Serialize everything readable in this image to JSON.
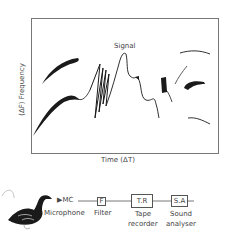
{
  "spectrogram": {
    "signal_label": "Signal",
    "x_axis_label": "Time (ΔT)",
    "y_axis_label": "(ΔF) Frequency"
  },
  "pipeline": {
    "source_icon": "goose-bird-icon",
    "microphone_short": "▶MC",
    "microphone_label": "Microphone",
    "filter_short": "F",
    "filter_label": "Filter",
    "tape_recorder_short": "T.R",
    "tape_recorder_label_line1": "Tape",
    "tape_recorder_label_line2": "recorder",
    "sound_analyser_short": "S.A",
    "sound_analyser_label_line1": "Sound",
    "sound_analyser_label_line2": "analyser"
  },
  "colors": {
    "ink": "#1a1a1a",
    "frame": "#777777",
    "text": "#444444"
  }
}
